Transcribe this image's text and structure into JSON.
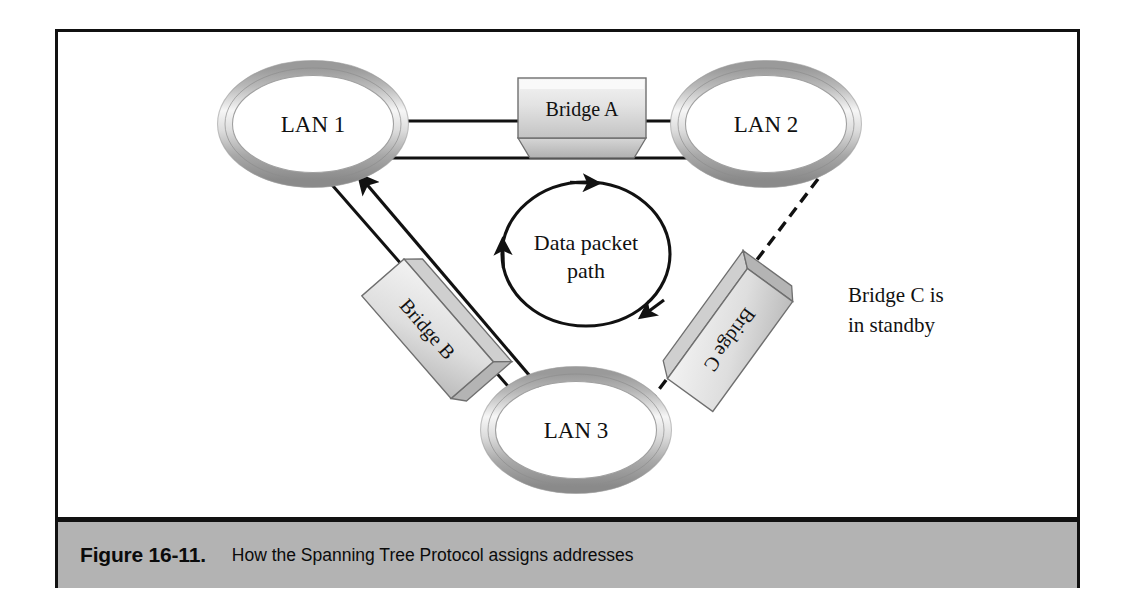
{
  "figure": {
    "caption_label": "Figure 16-11.",
    "caption_text": "How the Spanning Tree Protocol assigns addresses",
    "caption_bar_color": "#b3b3b3",
    "frame_border_color": "#111111",
    "background_color": "#ffffff"
  },
  "diagram": {
    "type": "network-topology",
    "nodes": [
      {
        "id": "lan1",
        "label": "LAN 1",
        "shape": "torus-ellipse",
        "cx": 255,
        "cy": 92
      },
      {
        "id": "lan2",
        "label": "LAN 2",
        "shape": "torus-ellipse",
        "cx": 708,
        "cy": 92
      },
      {
        "id": "lan3",
        "label": "LAN 3",
        "shape": "torus-ellipse",
        "cx": 518,
        "cy": 398
      }
    ],
    "bridges": [
      {
        "id": "bridge-a",
        "label": "Bridge A",
        "orientation": "horizontal",
        "state": "active"
      },
      {
        "id": "bridge-b",
        "label": "Bridge B",
        "orientation": "diagonal-down-right",
        "state": "active"
      },
      {
        "id": "bridge-c",
        "label": "Bridge C",
        "orientation": "diagonal-down-left",
        "state": "standby"
      }
    ],
    "links": [
      {
        "id": "link-lan1-bridgea",
        "from": "lan1",
        "to": "bridge-a",
        "style": "solid"
      },
      {
        "id": "link-bridgea-lan2",
        "from": "bridge-a",
        "to": "lan2",
        "style": "solid"
      },
      {
        "id": "link-lan1-lan3-via-bridgeb",
        "from": "lan1",
        "to": "lan3",
        "style": "solid"
      },
      {
        "id": "link-lan2-lan3-via-bridgec",
        "from": "lan2",
        "to": "lan3",
        "style": "dashed"
      }
    ],
    "flow_arrows": [
      {
        "id": "arrow-lan1-to-lan2",
        "from": "lan1",
        "to": "lan2",
        "direction": "right"
      },
      {
        "id": "arrow-lan3-to-lan1",
        "from": "lan3",
        "to": "lan1",
        "direction": "up-left"
      }
    ],
    "loop": {
      "id": "data-packet-loop",
      "label_line1": "Data packet",
      "label_line2": "path",
      "rotation": "clockwise",
      "arrowheads": 3
    },
    "annotation": {
      "id": "standby-note",
      "line1": "Bridge C is",
      "line2": "in standby"
    }
  },
  "colors": {
    "ink": "#111111",
    "torus_light": "#f2f2f2",
    "torus_mid": "#c9c9c9",
    "torus_dark": "#8e8e8e",
    "box_face_light": "#eeeeee",
    "box_face_dark": "#bdbdbd",
    "box_side": "#a9a9a9"
  }
}
